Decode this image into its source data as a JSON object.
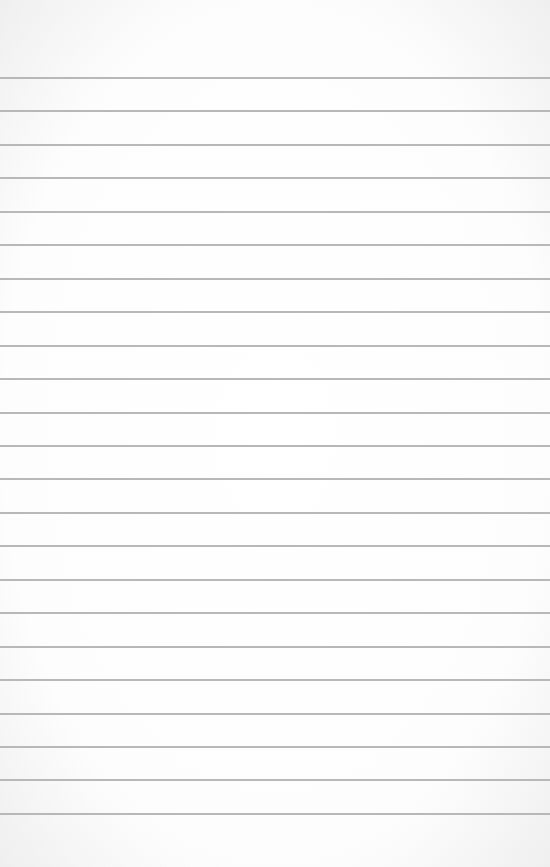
{
  "paper": {
    "type": "lined-paper",
    "line_count": 23,
    "first_line_y": 77,
    "line_spacing": 33.45,
    "line_color": "#b8b8b8",
    "background_color": "#ffffff"
  }
}
